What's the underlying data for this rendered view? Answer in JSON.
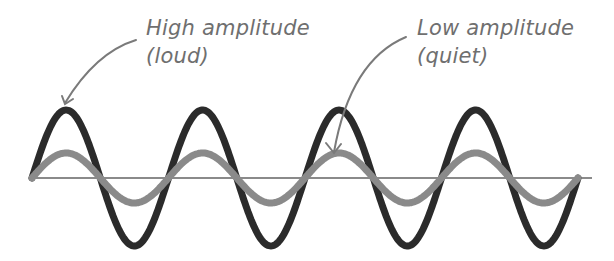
{
  "annotations": {
    "high": {
      "line1": "High amplitude",
      "line2": "(loud)"
    },
    "low": {
      "line1": "Low amplitude",
      "line2": "(quiet)"
    }
  },
  "colors": {
    "high_wave": "#2b2b2b",
    "low_wave": "#8a8a8a",
    "baseline": "#8a8a8a",
    "text": "#6f6f6f",
    "arrow": "#7a7a7a"
  },
  "waves": {
    "cycles": 4,
    "high_amplitude_label": "loud",
    "low_amplitude_label": "quiet"
  }
}
